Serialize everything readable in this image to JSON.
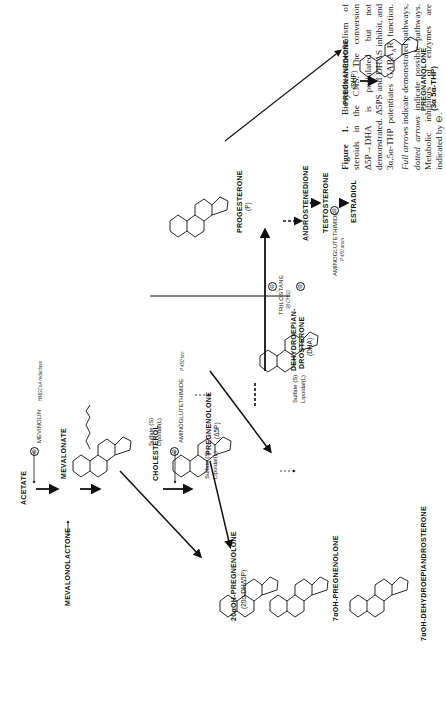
{
  "caption": {
    "figure_label": "Figure 1.",
    "text_1": "Biosynthesis/metabolism of steroids in the CNS. The conversion Δ5P→DHA is postulated but not demonstrated. Δ5PS and DHAS inhibit, and 3α,5α-THP potentiates GABA",
    "subscript": "A",
    "text_2": "R function.",
    "italic_full": "Full arrows",
    "text_3": "indicate demonstrated pathways,",
    "italic_dotted": "dotted arrows",
    "text_4": "indicate possible pathways. Metabolic inhibitors of enzymes are indicated by",
    "inhibitor_symbol": "⊖",
    "end": "."
  },
  "compounds": {
    "acetate": "ACETATE",
    "mevalonate": "MEVALONATE",
    "mevalonolactone": "MEVALONOLACTONE",
    "cholesterol": "CHOLESTEROL",
    "pregnenolone": "PREGNENOLONE",
    "pregnenolone_abbr": "(Δ5P)",
    "dha_line1": "DEHYDROEPIAN-",
    "dha_line2": "DROSTERONE",
    "dha_abbr": "(DHA)",
    "progesterone": "PROGESTERONE",
    "progesterone_abbr": "(P)",
    "androstenedione": "ANDROSTENEDIONE",
    "testosterone": "TESTOSTERONE",
    "estradiol": "ESTRADIOL",
    "pregnanedione": "PREGNANEDIONE",
    "pregnanedione_abbr": "(DHP)",
    "pregnanolone": "PREGNANOLONE",
    "pregnanolone_abbr": "(3α 5α-THP)",
    "oh20_preg": "20αOH-PREGNENOLONE",
    "oh20_preg_abbr": "(20α-DHΔ5P)",
    "oh7_preg": "7αOH-PREGNENOLONE",
    "oh7_dha": "7αOH-DEHYDROEPIANDROSTERONE"
  },
  "conjugates": {
    "sulfate": "Sulfate (S)",
    "lipoidal": "Lipoidal(L)"
  },
  "inhibitors": {
    "symbol": "⊖",
    "mevinolin": "MEVINOLIN",
    "mevinolin_enzyme": "HMGCoA reductase",
    "aminoglutethimide": "AMINOGLUTETHIMIDE",
    "aminoglutethimide_enzyme": "P 450 scc",
    "trilostane": "TRILOSTANE",
    "trilostane_enzyme": "3β OHSD",
    "aminoglutethimide2": "AMINOGLUTETHIMIDE",
    "aminoglutethimide2_enzyme": "P 450 arom"
  },
  "atoms": {
    "ho": "HO",
    "oh": "OH",
    "o": "O",
    "h": "H"
  }
}
